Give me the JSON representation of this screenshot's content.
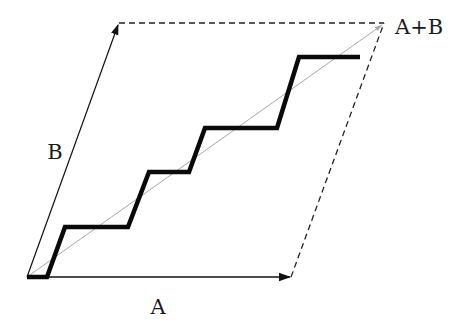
{
  "diagram": {
    "title": "",
    "labels": {
      "a": "A",
      "b": "B",
      "sum": "A+B"
    },
    "colors": {
      "ink": "#111111",
      "diagonal": "#b0b0b0",
      "background": "#ffffff"
    },
    "points": {
      "origin": [
        27,
        277
      ],
      "a_tip": [
        291,
        277
      ],
      "b_tip": [
        119,
        23
      ],
      "sum_tip": [
        384,
        23
      ]
    },
    "staircase": [
      [
        27,
        277
      ],
      [
        47,
        277
      ],
      [
        65,
        227
      ],
      [
        128,
        227
      ],
      [
        149,
        172
      ],
      [
        189,
        172
      ],
      [
        205,
        128
      ],
      [
        277,
        128
      ],
      [
        299,
        57
      ],
      [
        360,
        57
      ]
    ],
    "label_positions": {
      "a": [
        158,
        314
      ],
      "b": [
        55,
        159
      ],
      "sum": [
        395,
        34
      ]
    }
  }
}
